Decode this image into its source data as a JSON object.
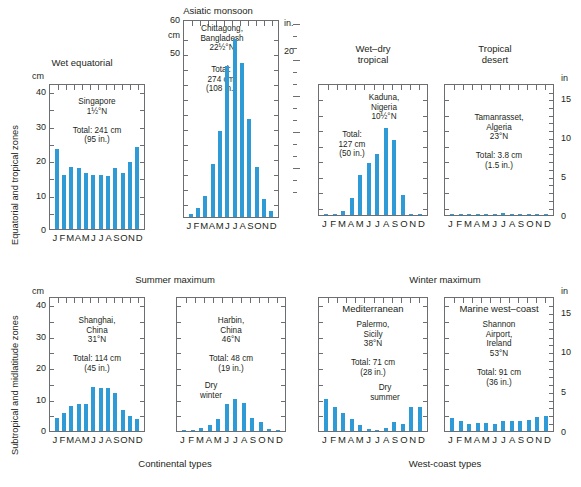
{
  "figure": {
    "row_labels": {
      "top": "Equatorial and tropical zones",
      "bottom": "Subtropical and midlatitude zones"
    },
    "group_headings": {
      "summer": "Summer maximum",
      "winter": "Winter maximum"
    },
    "group_captions": {
      "continental": "Continental types",
      "west_coast": "West-coast types"
    },
    "units": {
      "cm": "cm",
      "in_dot": "in.",
      "in": "in"
    },
    "months": [
      "J",
      "F",
      "M",
      "A",
      "M",
      "J",
      "J",
      "A",
      "S",
      "O",
      "N",
      "D"
    ],
    "colors": {
      "bar": "#2e9bd6",
      "frame": "#6d6e71",
      "text": "#231f20"
    }
  },
  "chart_data": [
    {
      "id": "wet-equatorial",
      "type": "bar",
      "title": "Wet equatorial",
      "station": "Singapore",
      "latitude": "1½°N",
      "total_label": "Total: 241 cm",
      "total_in_label": "(95 in.)",
      "note": "Singapore\n1½°N\n\nTotal: 241 cm\n(95 in.)",
      "categories": [
        "J",
        "F",
        "M",
        "A",
        "M",
        "J",
        "J",
        "A",
        "S",
        "O",
        "N",
        "D"
      ],
      "values": [
        25,
        17,
        19.5,
        19,
        17.5,
        17,
        17,
        16.5,
        19,
        17.5,
        21,
        25.5
      ],
      "ylabel": "cm",
      "ylim": [
        0,
        45
      ],
      "yticks": [
        0,
        10,
        20,
        30,
        40
      ],
      "grid": false
    },
    {
      "id": "asiatic-monsoon",
      "type": "bar",
      "title": "Asiatic monsoon",
      "station": "Chittagong, Bangladesh",
      "latitude": "22½°N",
      "total_label": "Total:\n274 cm\n(108 in.)",
      "note": "Chittagong,\nBangladesh\n22½°N",
      "categories": [
        "J",
        "F",
        "M",
        "A",
        "M",
        "J",
        "J",
        "A",
        "S",
        "O",
        "N",
        "D"
      ],
      "values": [
        1,
        3,
        7,
        18,
        29,
        51,
        60,
        52,
        33,
        17,
        6,
        2
      ],
      "ylabel": "cm",
      "ylabel_right": "in.",
      "ylim": [
        0,
        66
      ],
      "yticks": [
        50,
        60
      ],
      "yticks_right": [
        20
      ],
      "grid": false
    },
    {
      "id": "wet-dry-tropical",
      "type": "bar",
      "title": "Wet–dry\ntropical",
      "station": "Kaduna, Nigeria",
      "latitude": "10½°N",
      "total_label": "Total:\n127 cm\n(50 in.)",
      "note": "Kaduna,\nNigeria\n10½°N",
      "categories": [
        "J",
        "F",
        "M",
        "A",
        "M",
        "J",
        "J",
        "A",
        "S",
        "O",
        "N",
        "D"
      ],
      "values": [
        0.1,
        0.4,
        1.5,
        6,
        14,
        18,
        21,
        30,
        26,
        7,
        0.4,
        0.1
      ],
      "ylim": [
        0,
        45
      ],
      "grid": false
    },
    {
      "id": "tropical-desert",
      "type": "bar",
      "title": "Tropical\ndesert",
      "station": "Tamanrasset, Algeria",
      "latitude": "23°N",
      "total_label": "Total: 3.8 cm",
      "total_in_label": "(1.5 in.)",
      "note": "Tamanrasset,\nAlgeria\n23°N\n\nTotal: 3.8 cm\n(1.5 in.)",
      "categories": [
        "J",
        "F",
        "M",
        "A",
        "M",
        "J",
        "J",
        "A",
        "S",
        "O",
        "N",
        "D"
      ],
      "values": [
        0.4,
        0.3,
        0.4,
        0.3,
        0.3,
        0.5,
        0.8,
        0.5,
        0.3,
        0.4,
        0.3,
        0.4
      ],
      "ylabel_right": "in",
      "ylim": [
        0,
        45
      ],
      "yticks_right": [
        0,
        5,
        10,
        15
      ],
      "grid": false
    },
    {
      "id": "summer-max-shanghai",
      "type": "bar",
      "title": "",
      "station": "Shanghai, China",
      "latitude": "31°N",
      "total_label": "Total: 114 cm",
      "total_in_label": "(45 in.)",
      "note": "Shanghai,\nChina\n31°N\n\nTotal: 114 cm\n(45 in.)",
      "categories": [
        "J",
        "F",
        "M",
        "A",
        "M",
        "J",
        "J",
        "A",
        "S",
        "O",
        "N",
        "D"
      ],
      "values": [
        4.5,
        6,
        8.5,
        9,
        9,
        15,
        14.5,
        14.5,
        13,
        7,
        5,
        4
      ],
      "ylabel": "cm",
      "ylim": [
        0,
        45
      ],
      "yticks": [
        0,
        10,
        20,
        30,
        40
      ],
      "grid": false
    },
    {
      "id": "summer-max-harbin",
      "type": "bar",
      "title": "",
      "station": "Harbin, China",
      "latitude": "46°N",
      "total_label": "Total: 48 cm",
      "total_in_label": "(19 in.)",
      "note": "Harbin,\nChina\n46°N\n\nTotal: 48 cm\n(19 in.)",
      "annotation": "Dry\nwinter",
      "categories": [
        "J",
        "F",
        "M",
        "A",
        "M",
        "J",
        "J",
        "A",
        "S",
        "O",
        "N",
        "D"
      ],
      "values": [
        0.4,
        0.5,
        1,
        2,
        4,
        9,
        11,
        9.5,
        4.5,
        3,
        0.8,
        0.5
      ],
      "ylim": [
        0,
        45
      ],
      "grid": false
    },
    {
      "id": "winter-max-palermo",
      "type": "bar",
      "title": "Mediterranean",
      "station": "Palermo, Sicily",
      "latitude": "38°N",
      "total_label": "Total: 71 cm",
      "total_in_label": "(28 in.)",
      "note": "Palermo,\nSicily\n38°N\n\nTotal: 71 cm\n(28 in.)",
      "annotation": "Dry\nsummer",
      "categories": [
        "J",
        "F",
        "M",
        "A",
        "M",
        "J",
        "J",
        "A",
        "S",
        "O",
        "N",
        "D"
      ],
      "values": [
        11,
        8,
        6,
        4,
        2,
        0.7,
        0.3,
        1,
        3,
        2.5,
        8,
        8
      ],
      "ylim": [
        0,
        45
      ],
      "grid": false
    },
    {
      "id": "winter-max-shannon",
      "type": "bar",
      "title": "Marine west–coast",
      "station": "Shannon Airport, Ireland",
      "latitude": "53°N",
      "total_label": "Total: 91 cm",
      "total_in_label": "(36 in.)",
      "note": "Shannon\nAirport,\nIreland\n53°N\n\nTotal: 91 cm\n(36 in.)",
      "categories": [
        "J",
        "F",
        "M",
        "A",
        "M",
        "J",
        "J",
        "A",
        "S",
        "O",
        "N",
        "D"
      ],
      "values": [
        4.3,
        3.3,
        2.3,
        2.7,
        2.8,
        2.4,
        3.4,
        3.3,
        3.4,
        3.8,
        4.7,
        5
      ],
      "ylabel_right": "in",
      "yticks_right": [
        0,
        5,
        10,
        15
      ],
      "ylim": [
        0,
        45
      ],
      "grid": false
    }
  ]
}
